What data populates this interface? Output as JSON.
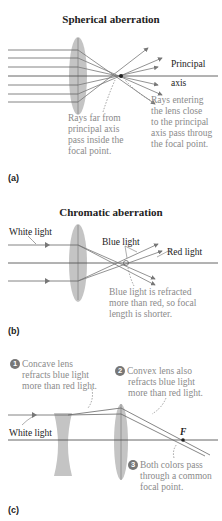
{
  "panel_a": {
    "title": "Spherical aberration",
    "axis_label_line1": "Principal",
    "axis_label_line2": "axis",
    "note_far": [
      "Rays far from",
      "principal axis",
      "pass inside the",
      "focal point."
    ],
    "note_close": [
      "Rays entering",
      "the lens close",
      "to the principal",
      "axis pass throug",
      "the focal point."
    ],
    "tag": "(a)"
  },
  "panel_b": {
    "title": "Chromatic aberration",
    "white_light": "White light",
    "blue_light": "Blue light",
    "red_light": "Red light",
    "note": [
      "Blue light is refracted",
      "more than red, so focal",
      "length is shorter."
    ],
    "tag": "(b)"
  },
  "panel_c": {
    "step1_num": "1",
    "step1": [
      "Concave lens",
      "refracts blue light",
      "more than red light."
    ],
    "step2_num": "2",
    "step2": [
      "Convex lens also",
      "refracts blue light",
      "more than red light."
    ],
    "step3_num": "3",
    "step3": [
      "Both colors pass",
      "through a common",
      "focal point."
    ],
    "white_light": "White light",
    "focal_label": "F",
    "tag": "(c)"
  },
  "colors": {
    "lens_fill": "#c4c4c4",
    "ray": "#6a6a6a",
    "note_text": "#8a8a8a",
    "axis": "#555555"
  }
}
